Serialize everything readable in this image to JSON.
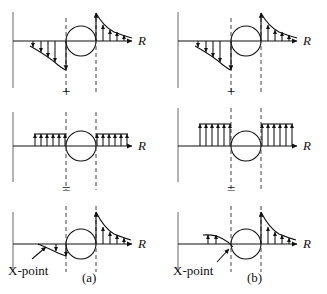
{
  "figure": {
    "axis_label": "R",
    "operator_plus": "+",
    "operator_equals": "=",
    "xpoint_label": "X-point",
    "colors": {
      "line": "#111111",
      "axis": "#7a7a7a",
      "dashed": "#555555",
      "background": "#ffffff"
    }
  },
  "panels": [
    {
      "id": "a",
      "caption": "(a)",
      "xpoint_label": "X-point",
      "operator_between_row1_row2": "+",
      "operator_between_row2_row3": "=",
      "rows": [
        {
          "id": "a-row1",
          "name": "antisymmetric-component",
          "axis_label": "R",
          "left_arrow_direction": "down",
          "right_arrow_direction": "up",
          "left_arrow_count": 5,
          "right_arrow_count": 5,
          "left_profile": "decaying-outward",
          "right_profile": "decaying-outward",
          "left_peak": 26,
          "right_peak": 26,
          "has_circle": true,
          "has_dashed_lines": true
        },
        {
          "id": "a-row2",
          "name": "uniform-component",
          "axis_label": "R",
          "left_arrow_direction": "up",
          "right_arrow_direction": "up",
          "left_arrow_count": 6,
          "right_arrow_count": 6,
          "left_profile": "uniform",
          "right_profile": "uniform",
          "left_peak": 12,
          "right_peak": 12,
          "has_circle": true,
          "has_dashed_lines": true
        },
        {
          "id": "a-row3",
          "name": "sum-result",
          "axis_label": "R",
          "left_arrow_direction": "down",
          "right_arrow_direction": "up",
          "left_arrow_count": 2,
          "right_arrow_count": 5,
          "left_profile": "small-residual-down",
          "right_profile": "decaying-outward",
          "left_peak": 8,
          "right_peak": 32,
          "has_circle": true,
          "has_dashed_lines": true,
          "has_xpoint_pointer": true
        }
      ]
    },
    {
      "id": "b",
      "caption": "(b)",
      "xpoint_label": "X-point",
      "operator_between_row1_row2": "+",
      "operator_between_row2_row3": "=",
      "rows": [
        {
          "id": "b-row1",
          "name": "antisymmetric-component",
          "axis_label": "R",
          "left_arrow_direction": "down",
          "right_arrow_direction": "up",
          "left_arrow_count": 5,
          "right_arrow_count": 5,
          "left_profile": "decaying-outward",
          "right_profile": "decaying-outward",
          "left_peak": 26,
          "right_peak": 26,
          "has_circle": true,
          "has_dashed_lines": true
        },
        {
          "id": "b-row2",
          "name": "uniform-component-stronger",
          "axis_label": "R",
          "left_arrow_direction": "up",
          "right_arrow_direction": "up",
          "left_arrow_count": 6,
          "right_arrow_count": 6,
          "left_profile": "uniform",
          "right_profile": "uniform",
          "left_peak": 22,
          "right_peak": 22,
          "has_circle": true,
          "has_dashed_lines": true
        },
        {
          "id": "b-row3",
          "name": "sum-result",
          "axis_label": "R",
          "left_arrow_direction": "up",
          "right_arrow_direction": "up",
          "left_arrow_count": 2,
          "right_arrow_count": 5,
          "left_profile": "small-residual-up",
          "right_profile": "decaying-outward",
          "left_peak": 9,
          "right_peak": 32,
          "has_circle": true,
          "has_dashed_lines": true,
          "has_xpoint_pointer": true
        }
      ]
    }
  ]
}
